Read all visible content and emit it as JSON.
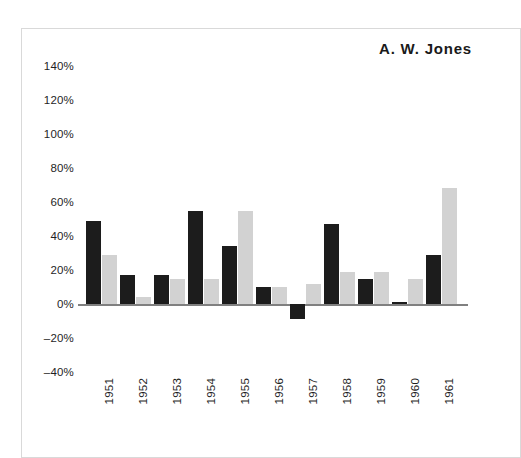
{
  "chart_data": {
    "type": "bar",
    "title": "A. W. Jones",
    "xlabel": "",
    "ylabel": "",
    "categories": [
      "1951",
      "1952",
      "1953",
      "1954",
      "1955",
      "1956",
      "1957",
      "1958",
      "1959",
      "1960",
      "1961"
    ],
    "series": [
      {
        "name": "dark",
        "color": "#1c1c1c",
        "values": [
          49,
          17,
          17,
          55,
          34,
          10,
          -9,
          47,
          15,
          1,
          29
        ]
      },
      {
        "name": "light",
        "color": "#d2d2d2",
        "values": [
          29,
          4,
          15,
          15,
          55,
          10,
          12,
          19,
          19,
          15,
          68
        ]
      }
    ],
    "ylim": [
      -40,
      140
    ],
    "ytick_values": [
      140,
      120,
      100,
      80,
      60,
      40,
      20,
      0,
      -20,
      -40
    ],
    "ytick_labels": [
      "140%",
      "120%",
      "100%",
      "80%",
      "60%",
      "40%",
      "20%",
      "0%",
      "–20%",
      "–40%"
    ],
    "grid": false,
    "legend": "none",
    "value_unit": "%"
  },
  "figure": {
    "border_color": "#d9d9d9",
    "background": "#ffffff",
    "zero_line_color": "#808080"
  }
}
